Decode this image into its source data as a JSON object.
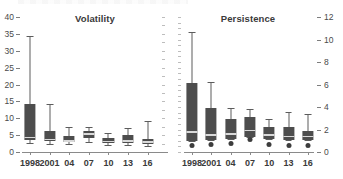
{
  "figure": {
    "background": "#ffffff",
    "box_color": "#4d4d4d",
    "median_color": "#d9d9d9",
    "whisker_color": "#5c5c5c",
    "axis_color": "#8a8a8a",
    "text_color": "#3a3a3a"
  },
  "chart_data": [
    {
      "type": "box",
      "title": "Volatility",
      "panel": "left",
      "xlabel": "",
      "ylabel": "",
      "ylim": [
        0,
        40
      ],
      "grid": false,
      "legend": "none",
      "axis_side": "left",
      "categories": [
        "1998",
        "2001",
        "04",
        "07",
        "10",
        "13",
        "16"
      ],
      "yticks": [
        0,
        5,
        10,
        15,
        20,
        25,
        30,
        35,
        40
      ],
      "ytick_labels": [
        "0",
        "5",
        "10",
        "15",
        "20",
        "25",
        "30",
        "35",
        "40"
      ],
      "boxes": [
        {
          "category": "1998",
          "whisker_low": 2.8,
          "q1": 3.5,
          "median": 4.3,
          "q3": 14.3,
          "whisker_high": 34.5,
          "outliers": []
        },
        {
          "category": "2001",
          "whisker_low": 2.4,
          "q1": 3.2,
          "median": 3.7,
          "q3": 6.3,
          "whisker_high": 14.3,
          "outliers": []
        },
        {
          "category": "04",
          "whisker_low": 2.3,
          "q1": 2.9,
          "median": 3.3,
          "q3": 4.7,
          "whisker_high": 7.3,
          "outliers": []
        },
        {
          "category": "07",
          "whisker_low": 3.1,
          "q1": 4.0,
          "median": 5.3,
          "q3": 6.2,
          "whisker_high": 7.5,
          "outliers": []
        },
        {
          "category": "10",
          "whisker_low": 2.0,
          "q1": 2.6,
          "median": 3.1,
          "q3": 4.2,
          "whisker_high": 5.6,
          "outliers": []
        },
        {
          "category": "13",
          "whisker_low": 2.1,
          "q1": 2.6,
          "median": 3.2,
          "q3": 4.9,
          "whisker_high": 7.2,
          "outliers": []
        },
        {
          "category": "16",
          "whisker_low": 1.8,
          "q1": 2.3,
          "median": 2.9,
          "q3": 3.9,
          "whisker_high": 9.3,
          "outliers": []
        }
      ]
    },
    {
      "type": "box",
      "title": "Persistence",
      "panel": "right",
      "xlabel": "",
      "ylabel": "",
      "ylim": [
        0,
        12
      ],
      "grid": false,
      "legend": "none",
      "axis_side": "right",
      "categories": [
        "1998",
        "2001",
        "04",
        "07",
        "10",
        "13",
        "16"
      ],
      "yticks": [
        0,
        2,
        4,
        6,
        8,
        10,
        12
      ],
      "ytick_labels": [
        "0",
        "2",
        "4",
        "6",
        "8",
        "10",
        "12"
      ],
      "boxes": [
        {
          "category": "1998",
          "whisker_low": 1.0,
          "q1": 1.0,
          "median": 1.8,
          "q3": 6.1,
          "whisker_high": 10.7,
          "outliers": [
            0.6
          ]
        },
        {
          "category": "2001",
          "whisker_low": 1.1,
          "q1": 1.1,
          "median": 1.5,
          "q3": 3.9,
          "whisker_high": 6.2,
          "outliers": [
            0.7
          ]
        },
        {
          "category": "04",
          "whisker_low": 1.2,
          "q1": 1.2,
          "median": 1.6,
          "q3": 2.9,
          "whisker_high": 3.9,
          "outliers": [
            0.8
          ]
        },
        {
          "category": "07",
          "whisker_low": 1.3,
          "q1": 1.3,
          "median": 1.9,
          "q3": 3.1,
          "whisker_high": 3.8,
          "outliers": [
            1.1
          ]
        },
        {
          "category": "10",
          "whisker_low": 1.2,
          "q1": 1.2,
          "median": 1.5,
          "q3": 2.2,
          "whisker_high": 2.9,
          "outliers": [
            0.7
          ]
        },
        {
          "category": "13",
          "whisker_low": 1.1,
          "q1": 1.1,
          "median": 1.4,
          "q3": 2.2,
          "whisker_high": 3.6,
          "outliers": [
            0.6
          ]
        },
        {
          "category": "16",
          "whisker_low": 1.1,
          "q1": 1.1,
          "median": 1.4,
          "q3": 1.9,
          "whisker_high": 3.4,
          "outliers": [
            0.6
          ]
        }
      ]
    }
  ]
}
